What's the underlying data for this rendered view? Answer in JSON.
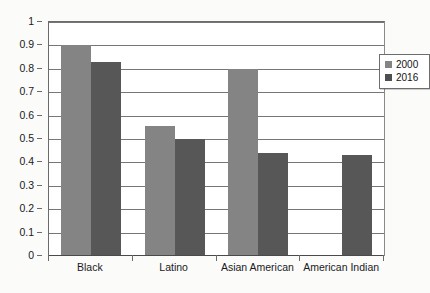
{
  "chart_data": {
    "type": "bar",
    "title": "",
    "subtitle": "",
    "xlabel": "",
    "ylabel": "",
    "categories": [
      "Black",
      "Latino",
      "Asian American",
      "American Indian"
    ],
    "series": [
      {
        "name": "2000",
        "color": "#848484",
        "values": [
          0.9,
          0.555,
          0.8,
          null
        ]
      },
      {
        "name": "2016",
        "color": "#575757",
        "values": [
          0.83,
          0.5,
          0.44,
          0.43
        ]
      }
    ],
    "ylim": [
      0,
      1
    ],
    "ytick_values": [
      1,
      0.9,
      0.8,
      0.7,
      0.6,
      0.5,
      0.4,
      0.3,
      0.2,
      0.1,
      0
    ],
    "ytick_labels": [
      "1",
      "0.9",
      "0.8",
      "0.7",
      "0.6",
      "0.5",
      "0.4",
      "0.3",
      "0.2",
      "0.1",
      "0"
    ],
    "grid": true,
    "grid_axis": "y",
    "legend_position": "top-right",
    "legend_entries": [
      "2000",
      "2016"
    ]
  },
  "colors": {
    "background": "#fbfbfa",
    "plot_background": "#ffffff",
    "gridline": "#767676",
    "axis": "#4a4a4a",
    "series_2000": "#848484",
    "series_2016": "#575757",
    "text": "#1a1a1a"
  }
}
